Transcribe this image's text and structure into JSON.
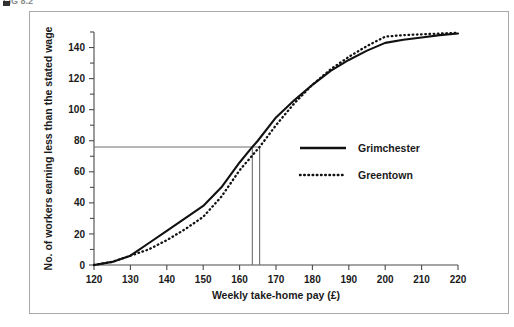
{
  "caption": {
    "text": "FIG 8.2",
    "marker_name": "caption-bullet"
  },
  "chart_data": {
    "type": "line",
    "title": "",
    "subtitle": "",
    "xlabel": "Weekly take-home pay (£)",
    "ylabel": "No. of workers earning less than the stated wage",
    "xlim": [
      120,
      220
    ],
    "ylim": [
      0,
      150
    ],
    "xticks": [
      120,
      130,
      140,
      150,
      160,
      170,
      180,
      190,
      200,
      210,
      220
    ],
    "xtick_labels": [
      "120",
      "130",
      "140",
      "150",
      "160",
      "170",
      "180",
      "190",
      "200",
      "210",
      "220"
    ],
    "yticks": [
      0,
      20,
      40,
      60,
      80,
      100,
      120,
      140
    ],
    "ytick_labels": [
      "0",
      "20",
      "40",
      "60",
      "80",
      "100",
      "120",
      "140"
    ],
    "yticks_minor": [
      10,
      30,
      50,
      70,
      90,
      110,
      130,
      150
    ],
    "grid": false,
    "legend_position": "center-right",
    "series": [
      {
        "name": "Grimchester",
        "style": "solid",
        "color": "#111111",
        "x": [
          120,
          125,
          130,
          135,
          140,
          145,
          150,
          155,
          160,
          163.5,
          165,
          170,
          175,
          180,
          185,
          190,
          195,
          200,
          205,
          210,
          215,
          220
        ],
        "values": [
          0,
          2,
          6,
          14,
          22,
          30,
          38,
          50,
          66,
          76,
          80,
          95,
          106,
          116,
          125,
          132,
          138,
          143,
          145,
          146.5,
          148,
          149
        ]
      },
      {
        "name": "Greentown",
        "style": "dotted",
        "color": "#111111",
        "x": [
          120,
          125,
          130,
          135,
          140,
          145,
          150,
          155,
          160,
          165.5,
          170,
          175,
          180,
          185,
          190,
          195,
          200,
          205,
          210,
          215,
          220
        ],
        "values": [
          0,
          2,
          6,
          10,
          16,
          23,
          31,
          44,
          61,
          76,
          90,
          104,
          116,
          126,
          134,
          141,
          147,
          148,
          148.5,
          149,
          149.5
        ]
      }
    ],
    "annotations": [
      {
        "name": "median-horizontal-line",
        "type": "hline",
        "y": 76,
        "x_from": 120,
        "x_to": 165.5
      },
      {
        "name": "median-grimchester-dropline",
        "type": "vline",
        "x": 163.5,
        "y_from": 0,
        "y_to": 76
      },
      {
        "name": "median-greentown-dropline",
        "type": "vline",
        "x": 165.5,
        "y_from": 0,
        "y_to": 76
      }
    ]
  },
  "legend": {
    "entries": [
      {
        "label": "Grimchester",
        "style": "solid"
      },
      {
        "label": "Greentown",
        "style": "dotted"
      }
    ]
  }
}
